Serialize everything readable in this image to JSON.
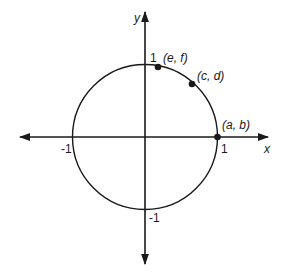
{
  "diagram": {
    "axes": {
      "x_label": "x",
      "y_label": "y",
      "tick_x_pos": "1",
      "tick_x_neg": "-1",
      "tick_y_pos": "1",
      "tick_y_neg": "-1"
    },
    "points": [
      {
        "label": "(a, b)",
        "x": 1,
        "y": 0
      },
      {
        "label": "(c, d)",
        "x": 0.7,
        "y": 0.71
      },
      {
        "label": "(e, f)",
        "x": 0.17,
        "y": 0.985
      }
    ],
    "colors": {
      "stroke": "#1a1a1a",
      "background": "#ffffff"
    }
  }
}
